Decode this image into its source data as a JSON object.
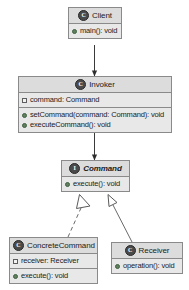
{
  "diagram": {
    "colors": {
      "box_fill": "#e8e8e8",
      "header_fill": "#dcdcdc",
      "border": "#8a8a8a",
      "line": "#4a4a4a",
      "text": "#1b1b1b",
      "background": "#ffffff"
    },
    "classes": {
      "client": {
        "name": "Client",
        "stereotype_icon": "class-icon",
        "stereotype_letter": "C",
        "fields": [],
        "methods": [
          {
            "label": "main(): void",
            "marker": "method-marker"
          }
        ]
      },
      "invoker": {
        "name": "Invoker",
        "stereotype_icon": "class-icon",
        "stereotype_letter": "C",
        "fields": [
          {
            "label": "command: Command",
            "marker": "field-marker"
          }
        ],
        "methods": [
          {
            "label": "setCommand(command: Command): void",
            "marker": "method-marker"
          },
          {
            "label": "executeCommand(): void",
            "marker": "method-marker"
          }
        ]
      },
      "command": {
        "name": "Command",
        "stereotype_icon": "interface-icon",
        "stereotype_letter": "I",
        "fields": [],
        "methods": [
          {
            "label": "execute(): void",
            "marker": "method-marker"
          }
        ]
      },
      "concrete_command": {
        "name": "ConcreteCommand",
        "stereotype_icon": "class-icon",
        "stereotype_letter": "C",
        "fields": [
          {
            "label": "receiver: Receiver",
            "marker": "field-marker"
          }
        ],
        "methods": [
          {
            "label": "execute(): void",
            "marker": "method-marker"
          }
        ]
      },
      "receiver": {
        "name": "Receiver",
        "stereotype_icon": "class-icon",
        "stereotype_letter": "C",
        "fields": [],
        "methods": [
          {
            "label": "operation(): void",
            "marker": "method-marker"
          }
        ]
      }
    },
    "relationships": [
      {
        "id": "client-to-invoker",
        "from": "Client",
        "to": "Invoker",
        "type": "association",
        "line": "solid",
        "arrowhead": "filled"
      },
      {
        "id": "invoker-to-command",
        "from": "Invoker",
        "to": "Command",
        "type": "association",
        "line": "solid",
        "arrowhead": "filled"
      },
      {
        "id": "concretecommand-to-command",
        "from": "ConcreteCommand",
        "to": "Command",
        "type": "realization",
        "line": "dashed",
        "arrowhead": "hollow-triangle"
      },
      {
        "id": "receiver-to-command",
        "from": "Receiver",
        "to": "Command",
        "type": "generalization",
        "line": "solid",
        "arrowhead": "hollow-triangle"
      }
    ]
  }
}
